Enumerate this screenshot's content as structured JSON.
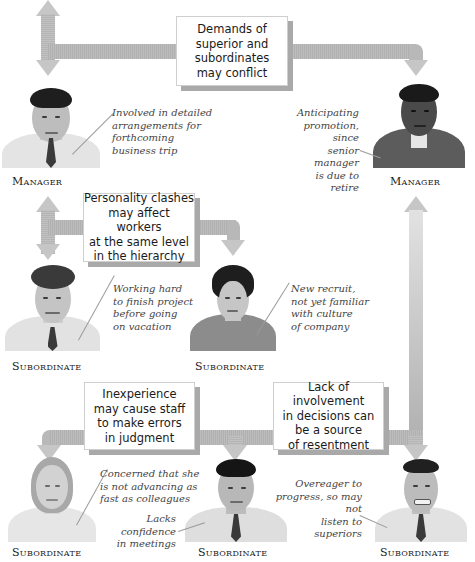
{
  "diagram": {
    "colors": {
      "arrow": "#b8b8b8",
      "box_shadow": "#a9a9a9",
      "text": "#1a1a1a",
      "note": "#444444"
    },
    "boxes": [
      {
        "id": "box-superior-subordinates",
        "text": "Demands of\nsuperior and\nsubordinates\nmay conflict"
      },
      {
        "id": "box-personality",
        "text": "Personality clashes\nmay affect workers\nat the same level\nin the hierarchy"
      },
      {
        "id": "box-inexperience",
        "text": "Inexperience\nmay cause staff\nto make errors\nin judgment"
      },
      {
        "id": "box-involvement",
        "text": "Lack of involvement\nin decisions can\nbe a source\nof resentment"
      }
    ],
    "people": [
      {
        "id": "manager-1",
        "role": "Manager",
        "note": "Involved in detailed\narrangements for\nforthcoming\nbusiness trip"
      },
      {
        "id": "manager-2",
        "role": "Manager",
        "note": "Anticipating\npromotion, since\nsenior manager\nis due to retire"
      },
      {
        "id": "subordinate-1",
        "role": "Subordinate",
        "note": "Working hard\nto finish project\nbefore going\non vacation"
      },
      {
        "id": "subordinate-2",
        "role": "Subordinate",
        "note": "New recruit,\nnot yet familiar\nwith culture\nof company"
      },
      {
        "id": "subordinate-3",
        "role": "Subordinate",
        "note": "Concerned that she\nis not advancing as\nfast as colleagues"
      },
      {
        "id": "subordinate-4",
        "role": "Subordinate",
        "note": "Lacks confidence\nin meetings"
      },
      {
        "id": "subordinate-5",
        "role": "Subordinate",
        "note": "Overeager to\nprogress, so may not\nlisten to superiors"
      }
    ]
  }
}
